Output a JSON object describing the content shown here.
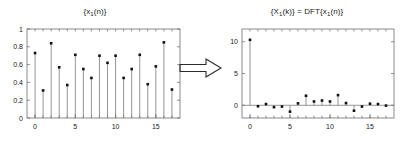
{
  "figure": {
    "background_color": "#ffffff",
    "stem_color": "#7a7a7a",
    "marker_color": "#111111",
    "axis_color": "#4d4d4d",
    "connector": {
      "glyph_name": "double-arrow-right",
      "symbol": "⇒"
    }
  },
  "left_panel": {
    "title_prefix": "{x",
    "title_sub": "1",
    "title_suffix": "(n)}",
    "title_plain": "{x1(n)}"
  },
  "right_panel": {
    "title_p1": "{X",
    "title_s1": "1",
    "title_p2": "(k)} = DFT{x",
    "title_s2": "1",
    "title_p3": "(n)}",
    "title_plain": "{X1(k)} = DFT{x1(n)}"
  },
  "chart_data": [
    {
      "id": "signal-x1n",
      "type": "stem",
      "title": "{x1(n)}",
      "xlabel": "",
      "ylabel": "",
      "x": [
        0,
        1,
        2,
        3,
        4,
        5,
        6,
        7,
        8,
        9,
        10,
        11,
        12,
        13,
        14,
        15,
        16,
        17
      ],
      "values": [
        0.73,
        0.31,
        0.84,
        0.57,
        0.37,
        0.71,
        0.55,
        0.45,
        0.7,
        0.62,
        0.7,
        0.45,
        0.55,
        0.71,
        0.38,
        0.58,
        0.85,
        0.32
      ],
      "xlim": [
        -1,
        18
      ],
      "ylim": [
        0,
        1
      ],
      "xticks": [
        0,
        5,
        10,
        15
      ],
      "xtick_labels": [
        "0",
        "5",
        "10",
        "15"
      ],
      "xminor_ticks": [
        0,
        1,
        2,
        3,
        4,
        5,
        6,
        7,
        8,
        9,
        10,
        11,
        12,
        13,
        14,
        15,
        16,
        17
      ],
      "yticks": [
        0,
        0.2,
        0.4,
        0.6,
        0.8,
        1
      ],
      "ytick_labels": [
        "0",
        "0.2",
        "0.4",
        "0.6",
        "0.8",
        "1"
      ],
      "grid": false,
      "box": true,
      "legend": null
    },
    {
      "id": "dft-X1k",
      "type": "stem",
      "title": "{X1(k)} = DFT{x1(n)}",
      "xlabel": "",
      "ylabel": "",
      "x": [
        0,
        1,
        2,
        3,
        4,
        5,
        6,
        7,
        8,
        9,
        10,
        11,
        12,
        13,
        14,
        15,
        16,
        17
      ],
      "values": [
        10.3,
        -0.15,
        0.2,
        -0.3,
        -0.2,
        -1.0,
        0.3,
        1.5,
        0.6,
        0.75,
        0.6,
        1.6,
        0.35,
        -0.85,
        -0.2,
        0.25,
        0.2,
        -0.05
      ],
      "xlim": [
        -1,
        18
      ],
      "ylim": [
        -2,
        12
      ],
      "xticks": [
        0,
        5,
        10,
        15
      ],
      "xtick_labels": [
        "0",
        "5",
        "10",
        "15"
      ],
      "xminor_ticks": [
        0,
        1,
        2,
        3,
        4,
        5,
        6,
        7,
        8,
        9,
        10,
        11,
        12,
        13,
        14,
        15,
        16,
        17
      ],
      "yticks": [
        0,
        5,
        10
      ],
      "ytick_labels": [
        "0",
        "5",
        "10"
      ],
      "grid": false,
      "box": true,
      "legend": null
    }
  ]
}
